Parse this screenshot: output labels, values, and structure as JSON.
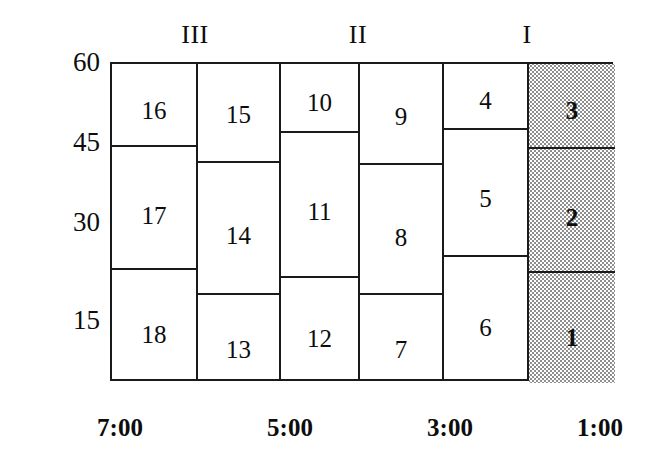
{
  "figure": {
    "type": "diagram"
  },
  "top_labels": [
    {
      "text": "III",
      "x_center": 195,
      "name": "group-label-iii"
    },
    {
      "text": "II",
      "x_center": 358,
      "name": "group-label-ii"
    },
    {
      "text": "I",
      "x_center": 527,
      "name": "group-label-i"
    }
  ],
  "y_axis": {
    "ticks": [
      {
        "label": "60",
        "y": 62
      },
      {
        "label": "45",
        "y": 142
      },
      {
        "label": "30",
        "y": 222
      },
      {
        "label": "15",
        "y": 320
      }
    ],
    "min": 0,
    "max": 60
  },
  "x_axis": {
    "ticks": [
      {
        "label": "7:00",
        "x_center": 120
      },
      {
        "label": "5:00",
        "x_center": 290
      },
      {
        "label": "3:00",
        "x_center": 450
      },
      {
        "label": "1:00",
        "x_center": 600
      }
    ]
  },
  "columns": [
    {
      "name": "column-1",
      "left": 0,
      "width": 86,
      "shaded": false,
      "cells": [
        {
          "label": "16",
          "top": 0,
          "height": 83,
          "label_offset": 34
        },
        {
          "label": "17",
          "top": 83,
          "height": 123,
          "label_offset": 56
        },
        {
          "label": "18",
          "top": 206,
          "height": 113,
          "label_offset": 52
        }
      ]
    },
    {
      "name": "column-2",
      "left": 86,
      "width": 83,
      "shaded": false,
      "cells": [
        {
          "label": "15",
          "top": 0,
          "height": 99,
          "label_offset": 38
        },
        {
          "label": "14",
          "top": 99,
          "height": 132,
          "label_offset": 60
        },
        {
          "label": "13",
          "top": 231,
          "height": 88,
          "label_offset": 42
        }
      ]
    },
    {
      "name": "column-3",
      "left": 169,
      "width": 79,
      "shaded": false,
      "cells": [
        {
          "label": "10",
          "top": 0,
          "height": 69,
          "label_offset": 26
        },
        {
          "label": "11",
          "top": 69,
          "height": 145,
          "label_offset": 66
        },
        {
          "label": "12",
          "top": 214,
          "height": 105,
          "label_offset": 48
        }
      ]
    },
    {
      "name": "column-4",
      "left": 248,
      "width": 84,
      "shaded": false,
      "cells": [
        {
          "label": "9",
          "top": 0,
          "height": 101,
          "label_offset": 40
        },
        {
          "label": "8",
          "top": 101,
          "height": 130,
          "label_offset": 60
        },
        {
          "label": "7",
          "top": 231,
          "height": 88,
          "label_offset": 42
        }
      ]
    },
    {
      "name": "column-5",
      "left": 332,
      "width": 85,
      "shaded": false,
      "cells": [
        {
          "label": "4",
          "top": 0,
          "height": 66,
          "label_offset": 24
        },
        {
          "label": "5",
          "top": 66,
          "height": 127,
          "label_offset": 56
        },
        {
          "label": "6",
          "top": 193,
          "height": 126,
          "label_offset": 58
        }
      ]
    },
    {
      "name": "column-6",
      "left": 417,
      "width": 86,
      "shaded": true,
      "cells": [
        {
          "label": "3",
          "top": 0,
          "height": 85,
          "label_offset": 34
        },
        {
          "label": "2",
          "top": 85,
          "height": 124,
          "label_offset": 56
        },
        {
          "label": "1",
          "top": 209,
          "height": 110,
          "label_offset": 52
        }
      ]
    }
  ]
}
